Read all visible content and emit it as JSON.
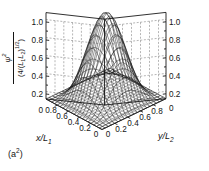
{
  "figure": {
    "panel_caption": "(a",
    "panel_caption_sup": "2",
    "panel_caption_close": ")",
    "background": "#ffffff",
    "line_color": "#1a1a1a"
  },
  "axes": {
    "z": {
      "label_numerator": "ψ",
      "label_numerator_sup": "2",
      "label_denominator": "(4/(L1L2)1/2)",
      "ticks_left": [
        "1.0",
        "0.8",
        "0.6",
        "0.4",
        "0.2",
        "0"
      ],
      "ticks_right": [
        "1.0",
        "0.8",
        "0.6",
        "0.4",
        "0.2",
        "0"
      ],
      "range": [
        0,
        1
      ]
    },
    "x": {
      "label": "x/L1",
      "ticks": [
        "0.8",
        "0.6",
        "0.4",
        "0.2",
        "0"
      ],
      "range": [
        0,
        1
      ]
    },
    "y": {
      "label": "y/L2",
      "ticks": [
        "0",
        "0.2",
        "0.4",
        "0.6",
        "0.8"
      ],
      "range": [
        0,
        1
      ]
    }
  },
  "chart_data": {
    "type": "surface",
    "title": "",
    "xlabel": "x/L1",
    "ylabel": "y/L2",
    "zlabel": "psi^2 / (4/(L1 L2)^(1/2))",
    "xlim": [
      0,
      1
    ],
    "ylim": [
      0,
      1
    ],
    "zlim": [
      0,
      1
    ],
    "grid": true,
    "legend": "none",
    "function": "sin^2(pi*x/L1) * sin^2(pi*y/L2)",
    "mesh_n": 21,
    "x": [
      0,
      0.05,
      0.1,
      0.15,
      0.2,
      0.25,
      0.3,
      0.35,
      0.4,
      0.45,
      0.5,
      0.55,
      0.6,
      0.65,
      0.7,
      0.75,
      0.8,
      0.85,
      0.9,
      0.95,
      1.0
    ],
    "y": [
      0,
      0.05,
      0.1,
      0.15,
      0.2,
      0.25,
      0.3,
      0.35,
      0.4,
      0.45,
      0.5,
      0.55,
      0.6,
      0.65,
      0.7,
      0.75,
      0.8,
      0.85,
      0.9,
      0.95,
      1.0
    ],
    "z_profile_at_y_center": [
      0,
      0.024,
      0.095,
      0.206,
      0.345,
      0.5,
      0.655,
      0.794,
      0.905,
      0.976,
      1.0,
      0.976,
      0.905,
      0.794,
      0.655,
      0.5,
      0.345,
      0.206,
      0.095,
      0.024,
      0
    ],
    "z_max": 1.0,
    "z_max_location": {
      "x": 0.5,
      "y": 0.5
    },
    "z_ticks": [
      0,
      0.2,
      0.4,
      0.6,
      0.8,
      1.0
    ]
  }
}
